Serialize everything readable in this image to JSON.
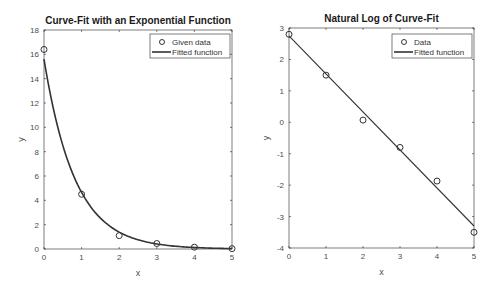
{
  "chart_data": [
    {
      "type": "scatter",
      "title": "Curve-Fit with an Exponential Function",
      "xlabel": "x",
      "ylabel": "y",
      "xlim": [
        0,
        5
      ],
      "ylim": [
        0,
        18
      ],
      "xticks": [
        "0",
        "1",
        "2",
        "3",
        "4",
        "5"
      ],
      "yticks": [
        "0",
        "2",
        "4",
        "6",
        "8",
        "10",
        "12",
        "14",
        "16",
        "18"
      ],
      "grid": false,
      "legend_position": "top-right",
      "series": [
        {
          "name": "Given data",
          "kind": "markers",
          "marker": "circle",
          "x": [
            0,
            1,
            2,
            3,
            4,
            5
          ],
          "y": [
            16.4,
            4.5,
            1.1,
            0.45,
            0.15,
            0.03
          ]
        },
        {
          "name": "Fitted function",
          "kind": "line",
          "equation": "y = 15.6*exp(-1.21x)",
          "a": 15.6,
          "b": -1.21
        }
      ]
    },
    {
      "type": "scatter",
      "title": "Natural Log of Curve-Fit",
      "xlabel": "x",
      "ylabel": "y",
      "xlim": [
        0,
        5
      ],
      "ylim": [
        -4,
        3
      ],
      "xticks": [
        "0",
        "1",
        "2",
        "3",
        "4",
        "5"
      ],
      "yticks": [
        "-4",
        "-3",
        "-2",
        "-1",
        "0",
        "1",
        "2",
        "3"
      ],
      "grid": false,
      "legend_position": "top-right",
      "series": [
        {
          "name": "Data",
          "kind": "markers",
          "marker": "circle",
          "x": [
            0,
            1,
            2,
            3,
            4,
            5
          ],
          "y": [
            2.8,
            1.5,
            0.07,
            -0.8,
            -1.87,
            -3.5
          ]
        },
        {
          "name": "Fitted function",
          "kind": "line",
          "x": [
            0,
            5
          ],
          "y": [
            2.75,
            -3.3
          ]
        }
      ]
    }
  ]
}
